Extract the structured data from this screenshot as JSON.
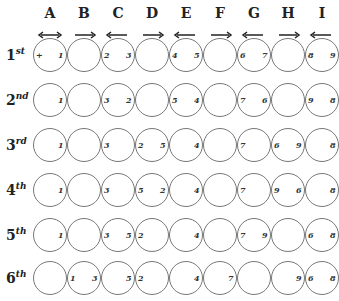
{
  "columns": [
    {
      "letter": "A",
      "arrow": "both"
    },
    {
      "letter": "B",
      "arrow": "right"
    },
    {
      "letter": "C",
      "arrow": "left"
    },
    {
      "letter": "D",
      "arrow": "right"
    },
    {
      "letter": "E",
      "arrow": "left"
    },
    {
      "letter": "F",
      "arrow": "right"
    },
    {
      "letter": "G",
      "arrow": "left"
    },
    {
      "letter": "H",
      "arrow": "right"
    },
    {
      "letter": "I",
      "arrow": "left"
    }
  ],
  "rows": [
    {
      "ordinal": "1",
      "suffix": "st",
      "labels": [
        {
          "col": 0,
          "side": "left",
          "text": "+"
        },
        {
          "col": 0,
          "side": "right",
          "text": "1"
        },
        {
          "col": 2,
          "side": "left",
          "text": "2"
        },
        {
          "col": 2,
          "side": "right",
          "text": "3"
        },
        {
          "col": 4,
          "side": "left",
          "text": "4"
        },
        {
          "col": 4,
          "side": "right",
          "text": "5"
        },
        {
          "col": 6,
          "side": "left",
          "text": "6"
        },
        {
          "col": 6,
          "side": "right",
          "text": "7"
        },
        {
          "col": 8,
          "side": "left",
          "text": "8"
        },
        {
          "col": 8,
          "side": "right",
          "text": "9"
        }
      ]
    },
    {
      "ordinal": "2",
      "suffix": "nd",
      "labels": [
        {
          "col": 0,
          "side": "right",
          "text": "1"
        },
        {
          "col": 2,
          "side": "left",
          "text": "3"
        },
        {
          "col": 2,
          "side": "right",
          "text": "2"
        },
        {
          "col": 4,
          "side": "left",
          "text": "5"
        },
        {
          "col": 4,
          "side": "right",
          "text": "4"
        },
        {
          "col": 6,
          "side": "left",
          "text": "7"
        },
        {
          "col": 6,
          "side": "right",
          "text": "6"
        },
        {
          "col": 8,
          "side": "left",
          "text": "9"
        },
        {
          "col": 8,
          "side": "right",
          "text": "8"
        }
      ]
    },
    {
      "ordinal": "3",
      "suffix": "rd",
      "labels": [
        {
          "col": 0,
          "side": "right",
          "text": "1"
        },
        {
          "col": 2,
          "side": "left",
          "text": "3"
        },
        {
          "col": 3,
          "side": "left",
          "text": "2"
        },
        {
          "col": 3,
          "side": "right",
          "text": "5"
        },
        {
          "col": 4,
          "side": "right",
          "text": "4"
        },
        {
          "col": 6,
          "side": "left",
          "text": "7"
        },
        {
          "col": 7,
          "side": "left",
          "text": "6"
        },
        {
          "col": 7,
          "side": "right",
          "text": "9"
        },
        {
          "col": 8,
          "side": "right",
          "text": "8"
        }
      ]
    },
    {
      "ordinal": "4",
      "suffix": "th",
      "labels": [
        {
          "col": 0,
          "side": "right",
          "text": "1"
        },
        {
          "col": 2,
          "side": "left",
          "text": "3"
        },
        {
          "col": 3,
          "side": "left",
          "text": "5"
        },
        {
          "col": 3,
          "side": "right",
          "text": "2"
        },
        {
          "col": 4,
          "side": "right",
          "text": "4"
        },
        {
          "col": 6,
          "side": "left",
          "text": "7"
        },
        {
          "col": 7,
          "side": "left",
          "text": "9"
        },
        {
          "col": 7,
          "side": "right",
          "text": "6"
        },
        {
          "col": 8,
          "side": "right",
          "text": "8"
        }
      ]
    },
    {
      "ordinal": "5",
      "suffix": "th",
      "labels": [
        {
          "col": 0,
          "side": "right",
          "text": "1"
        },
        {
          "col": 2,
          "side": "left",
          "text": "3"
        },
        {
          "col": 2,
          "side": "right",
          "text": "5"
        },
        {
          "col": 3,
          "side": "left",
          "text": "2"
        },
        {
          "col": 4,
          "side": "right",
          "text": "4"
        },
        {
          "col": 6,
          "side": "left",
          "text": "7"
        },
        {
          "col": 6,
          "side": "right",
          "text": "9"
        },
        {
          "col": 8,
          "side": "left",
          "text": "6"
        },
        {
          "col": 8,
          "side": "right",
          "text": "8"
        }
      ]
    },
    {
      "ordinal": "6",
      "suffix": "th",
      "labels": [
        {
          "col": 1,
          "side": "left",
          "text": "1"
        },
        {
          "col": 1,
          "side": "right",
          "text": "3"
        },
        {
          "col": 2,
          "side": "right",
          "text": "5"
        },
        {
          "col": 3,
          "side": "left",
          "text": "2"
        },
        {
          "col": 4,
          "side": "right",
          "text": "4"
        },
        {
          "col": 5,
          "side": "right",
          "text": "7"
        },
        {
          "col": 7,
          "side": "right",
          "text": "9"
        },
        {
          "col": 8,
          "side": "left",
          "text": "6"
        },
        {
          "col": 8,
          "side": "right",
          "text": "8"
        }
      ]
    }
  ]
}
